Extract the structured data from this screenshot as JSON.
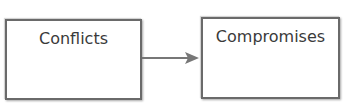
{
  "nodes": [
    {
      "id": "conflicts",
      "label": "Conflicts"
    },
    {
      "id": "compromises",
      "label": "Compromises"
    }
  ],
  "edges": [
    {
      "from": "conflicts",
      "to": "compromises"
    }
  ],
  "colors": {
    "border": "#6a6a6a",
    "arrow": "#777777",
    "text": "#3a3a3a"
  }
}
